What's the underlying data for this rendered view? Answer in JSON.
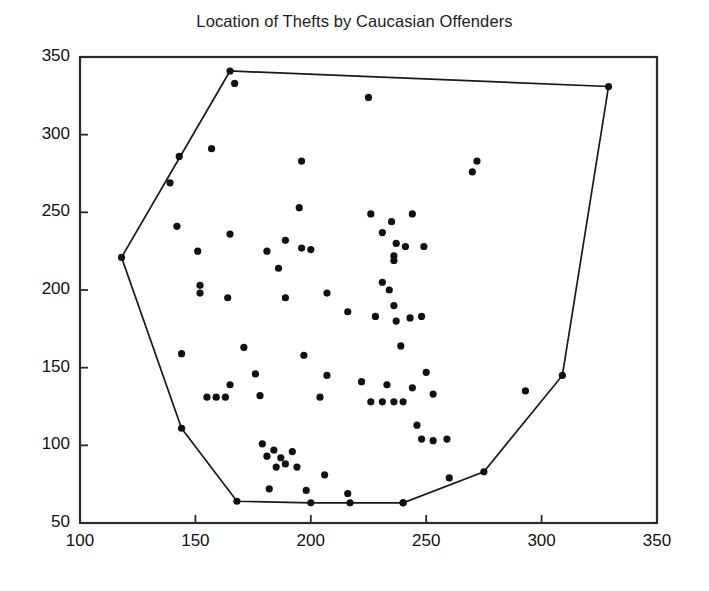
{
  "chart_data": {
    "type": "scatter",
    "title": "Location of Thefts by Caucasian Offenders",
    "xlabel": "",
    "ylabel": "",
    "xlim": [
      100,
      350
    ],
    "ylim": [
      50,
      350
    ],
    "xticks": [
      100,
      150,
      200,
      250,
      300,
      350
    ],
    "yticks": [
      50,
      100,
      150,
      200,
      250,
      300,
      350
    ],
    "xtick_labels": [
      "100",
      "150",
      "200",
      "250",
      "300",
      "350"
    ],
    "ytick_labels": [
      "50",
      "100",
      "150",
      "200",
      "250",
      "300",
      "350"
    ],
    "grid": false,
    "legend": null,
    "marker": "filled-circle",
    "marker_color": "#111111",
    "hull_color": "#1a1a1a",
    "axis_color": "#2a2a2a",
    "background": "#ffffff",
    "series": [
      {
        "name": "Theft locations",
        "points": [
          [
            165,
            341
          ],
          [
            167,
            333
          ],
          [
            225,
            324
          ],
          [
            329,
            331
          ],
          [
            143,
            286
          ],
          [
            157,
            291
          ],
          [
            196,
            283
          ],
          [
            272,
            283
          ],
          [
            139,
            269
          ],
          [
            270,
            276
          ],
          [
            142,
            241
          ],
          [
            195,
            253
          ],
          [
            226,
            249
          ],
          [
            244,
            249
          ],
          [
            118,
            221
          ],
          [
            151,
            225
          ],
          [
            165,
            236
          ],
          [
            181,
            225
          ],
          [
            189,
            232
          ],
          [
            186,
            214
          ],
          [
            196,
            227
          ],
          [
            200,
            226
          ],
          [
            231,
            237
          ],
          [
            235,
            244
          ],
          [
            237,
            230
          ],
          [
            241,
            228
          ],
          [
            249,
            228
          ],
          [
            236,
            222
          ],
          [
            236,
            219
          ],
          [
            152,
            203
          ],
          [
            152,
            198
          ],
          [
            164,
            195
          ],
          [
            189,
            195
          ],
          [
            207,
            198
          ],
          [
            231,
            205
          ],
          [
            234,
            200
          ],
          [
            236,
            190
          ],
          [
            216,
            186
          ],
          [
            228,
            183
          ],
          [
            237,
            180
          ],
          [
            243,
            182
          ],
          [
            248,
            183
          ],
          [
            239,
            164
          ],
          [
            144,
            159
          ],
          [
            171,
            163
          ],
          [
            197,
            158
          ],
          [
            165,
            139
          ],
          [
            176,
            146
          ],
          [
            207,
            145
          ],
          [
            222,
            141
          ],
          [
            233,
            139
          ],
          [
            244,
            137
          ],
          [
            250,
            147
          ],
          [
            253,
            133
          ],
          [
            293,
            135
          ],
          [
            309,
            145
          ],
          [
            155,
            131
          ],
          [
            159,
            131
          ],
          [
            163,
            131
          ],
          [
            178,
            132
          ],
          [
            204,
            131
          ],
          [
            226,
            128
          ],
          [
            231,
            128
          ],
          [
            236,
            128
          ],
          [
            240,
            128
          ],
          [
            144,
            111
          ],
          [
            248,
            104
          ],
          [
            253,
            103
          ],
          [
            259,
            104
          ],
          [
            179,
            101
          ],
          [
            184,
            97
          ],
          [
            187,
            92
          ],
          [
            192,
            96
          ],
          [
            189,
            88
          ],
          [
            185,
            86
          ],
          [
            181,
            93
          ],
          [
            194,
            86
          ],
          [
            246,
            113
          ],
          [
            275,
            83
          ],
          [
            260,
            79
          ],
          [
            182,
            72
          ],
          [
            198,
            71
          ],
          [
            216,
            69
          ],
          [
            206,
            81
          ],
          [
            240,
            63
          ],
          [
            168,
            64
          ],
          [
            200,
            63
          ],
          [
            217,
            63
          ],
          [
            240,
            63
          ]
        ]
      }
    ],
    "convex_hull": {
      "name": "convex hull boundary",
      "vertices": [
        [
          118,
          221
        ],
        [
          165,
          341
        ],
        [
          329,
          331
        ],
        [
          309,
          145
        ],
        [
          275,
          83
        ],
        [
          240,
          63
        ],
        [
          217,
          63
        ],
        [
          200,
          63
        ],
        [
          168,
          64
        ],
        [
          144,
          111
        ]
      ]
    }
  }
}
